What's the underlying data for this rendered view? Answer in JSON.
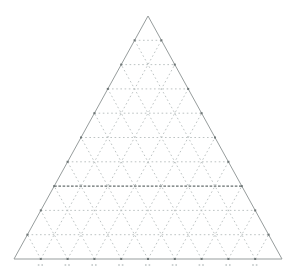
{
  "figure": {
    "width": 296,
    "height": 277,
    "background": "#ffffff",
    "title": ""
  },
  "chart_data": {
    "type": "ternary-grid",
    "title": "",
    "subtitle": "",
    "series": [],
    "divisions": 10,
    "vertices": {
      "top": [
        148,
        16
      ],
      "bottom_left": [
        14,
        259
      ],
      "bottom_right": [
        282,
        259
      ]
    },
    "outline": {
      "color": "#979d9d",
      "width": 1
    },
    "grid": {
      "style": "dashed",
      "color": "#b6bcbc",
      "width": 0.9,
      "dash": "1.6 2.6",
      "families": [
        "parallel-to-base",
        "parallel-to-left-edge",
        "parallel-to-right-edge"
      ]
    },
    "emphasized_gridline": {
      "family": "parallel-to-base",
      "index_from_apex": 7,
      "color": "#666e6e",
      "width": 1.3,
      "dash": "2.6 1.6"
    },
    "edge_ticks": {
      "color": "#6e7676",
      "size": 2
    },
    "base_tick_marks": {
      "visible": true,
      "legible": false,
      "color": "#cdd2d2",
      "offset_below_base": 5
    },
    "legend": null,
    "axis_labels": {
      "left": "",
      "right": "",
      "bottom": ""
    }
  }
}
